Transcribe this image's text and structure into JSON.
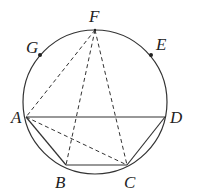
{
  "figure": {
    "type": "geometry-diagram",
    "circle": {
      "cx": 95,
      "cy": 102,
      "r": 72
    },
    "points": [
      {
        "name": "F",
        "x": 95,
        "y": 30,
        "label": "F",
        "lx": 89,
        "ly": 22,
        "marked": false
      },
      {
        "name": "G",
        "x": 40,
        "y": 55,
        "label": "G",
        "lx": 26,
        "ly": 53,
        "marked": true
      },
      {
        "name": "E",
        "x": 151,
        "y": 55,
        "label": "E",
        "lx": 156,
        "ly": 50,
        "marked": true
      },
      {
        "name": "A",
        "x": 26,
        "y": 117,
        "label": "A",
        "lx": 11,
        "ly": 123,
        "marked": false
      },
      {
        "name": "D",
        "x": 165,
        "y": 117,
        "label": "D",
        "lx": 170,
        "ly": 123,
        "marked": false
      },
      {
        "name": "B",
        "x": 66,
        "y": 165,
        "label": "B",
        "lx": 55,
        "ly": 188,
        "marked": false
      },
      {
        "name": "C",
        "x": 127,
        "y": 165,
        "label": "C",
        "lx": 124,
        "ly": 188,
        "marked": false
      }
    ],
    "solid_segments": [
      [
        "A",
        "D"
      ],
      [
        "A",
        "B"
      ],
      [
        "B",
        "C"
      ],
      [
        "C",
        "D"
      ]
    ],
    "dashed_segments": [
      [
        "F",
        "A"
      ],
      [
        "F",
        "B"
      ],
      [
        "F",
        "C"
      ],
      [
        "A",
        "C"
      ]
    ]
  },
  "labels": {
    "F": "F",
    "G": "G",
    "E": "E",
    "A": "A",
    "D": "D",
    "B": "B",
    "C": "C"
  }
}
